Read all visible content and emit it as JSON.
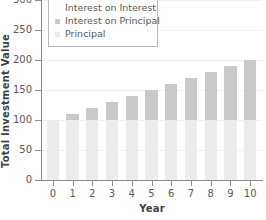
{
  "chart_data": {
    "type": "bar",
    "subtype": "stacked-bar",
    "title": "",
    "xlabel": "Year",
    "ylabel": "Total Investment Value",
    "categories": [
      "0",
      "1",
      "2",
      "3",
      "4",
      "5",
      "6",
      "7",
      "8",
      "9",
      "10"
    ],
    "x": [
      0,
      1,
      2,
      3,
      4,
      5,
      6,
      7,
      8,
      9,
      10
    ],
    "series": [
      {
        "name": "Principal",
        "color": "#ececec",
        "values": [
          100,
          100,
          100,
          100,
          100,
          100,
          100,
          100,
          100,
          100,
          100
        ]
      },
      {
        "name": "Interest on Principal",
        "color": "#c9c9c9",
        "values": [
          0,
          10,
          20,
          30,
          40,
          50,
          60,
          70,
          80,
          90,
          100
        ]
      },
      {
        "name": "Interest on Interest",
        "color": "#ffffff",
        "values": [
          0,
          0,
          0,
          0,
          0,
          0,
          0,
          0,
          0,
          0,
          0
        ]
      }
    ],
    "totals": [
      100,
      110,
      120,
      130,
      140,
      150,
      160,
      170,
      180,
      190,
      200
    ],
    "ylim": [
      0,
      300
    ],
    "yticks": [
      0,
      50,
      100,
      150,
      200,
      250,
      300
    ],
    "ytick_labels": [
      "0",
      "50",
      "100",
      "150",
      "200",
      "250",
      "300"
    ],
    "xlim": [
      -0.6,
      10.6
    ],
    "grid": true,
    "legend_position": "upper left",
    "legend_entries": [
      {
        "label": "Interest on Interest",
        "color": "#ffffff"
      },
      {
        "label": "Interest on Principal",
        "color": "#c9c9c9"
      },
      {
        "label": "Principal",
        "color": "#ececec"
      }
    ]
  },
  "axes": {
    "y_title": "Total Investment Value",
    "x_title": "Year",
    "y_ticks": [
      {
        "value": 300,
        "label": "300"
      },
      {
        "value": 250,
        "label": "250"
      },
      {
        "value": 200,
        "label": "200"
      },
      {
        "value": 150,
        "label": "150"
      },
      {
        "value": 100,
        "label": "100"
      },
      {
        "value": 50,
        "label": "50"
      },
      {
        "value": 0,
        "label": "0"
      }
    ],
    "x_ticks": [
      {
        "value": 0,
        "label": "0"
      },
      {
        "value": 1,
        "label": "1"
      },
      {
        "value": 2,
        "label": "2"
      },
      {
        "value": 3,
        "label": "3"
      },
      {
        "value": 4,
        "label": "4"
      },
      {
        "value": 5,
        "label": "5"
      },
      {
        "value": 6,
        "label": "6"
      },
      {
        "value": 7,
        "label": "7"
      },
      {
        "value": 8,
        "label": "8"
      },
      {
        "value": 9,
        "label": "9"
      },
      {
        "value": 10,
        "label": "10"
      }
    ]
  },
  "colors": {
    "principal": "#ececec",
    "interest_on_principal": "#c9c9c9",
    "interest_on_interest": "#ffffff",
    "axis": "#8a8a8a",
    "grid": "#f0f0f0",
    "text": "#5a5a5a",
    "title_text": "#3f3f3f",
    "background": "#ffffff"
  }
}
